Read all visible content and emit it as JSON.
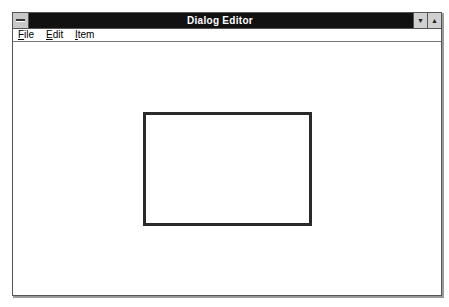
{
  "window": {
    "title": "Dialog Editor",
    "system_menu_icon": "system-menu-icon",
    "minimize_icon": "▼",
    "maximize_icon": "▲"
  },
  "menubar": {
    "items": [
      {
        "label": "File",
        "mnemonic": "F",
        "rest": "ile"
      },
      {
        "label": "Edit",
        "mnemonic": "E",
        "rest": "dit"
      },
      {
        "label": "Item",
        "mnemonic": "I",
        "rest": "tem"
      }
    ]
  },
  "canvas": {
    "dialog_frame": {
      "x": 142,
      "y": 111,
      "width": 169,
      "height": 114
    }
  },
  "colors": {
    "titlebar": "#111111",
    "title_text": "#ffffff",
    "frame_border": "#2a2a2a"
  }
}
